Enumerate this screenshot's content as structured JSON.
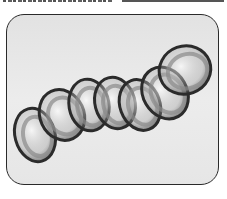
{
  "figure": {
    "ring_count": 7,
    "top_caption_fragment": "",
    "colors": {
      "panel_background": "#e6e6e6",
      "panel_border": "#2a2a2a",
      "ring_dark": "#2b2b2b",
      "ring_mid": "#8a8a8a",
      "ring_light": "#e8e8e8"
    }
  }
}
